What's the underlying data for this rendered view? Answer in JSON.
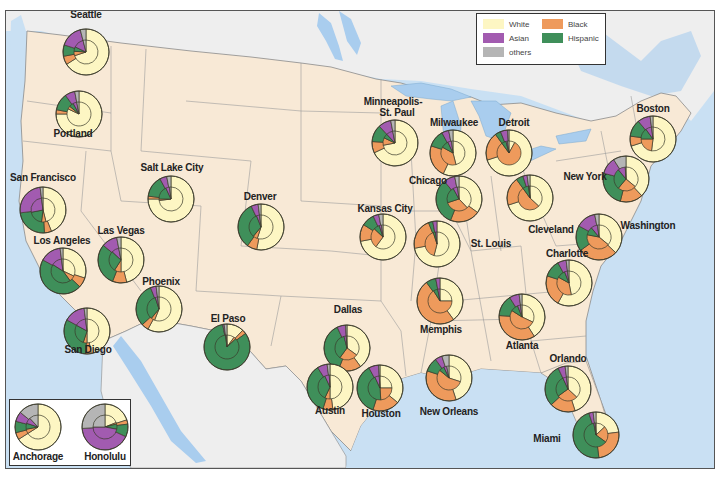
{
  "legend": {
    "items": [
      {
        "key": "white",
        "label": "White",
        "color": "#fdf6c3"
      },
      {
        "key": "black",
        "label": "Black",
        "color": "#ee9a5c"
      },
      {
        "key": "hispanic",
        "label": "Hispanic",
        "color": "#3f8f5a"
      },
      {
        "key": "asian",
        "label": "Asian",
        "color": "#a25bb0"
      },
      {
        "key": "others",
        "label": "others",
        "color": "#b5b5b5"
      }
    ]
  },
  "colors": {
    "water": "#c9e0f3",
    "us_land": "#f8e9d6",
    "foreign_land": "#eeeeee",
    "lake": "#a9cdee",
    "border": "#8a8a8a"
  },
  "chart_data": {
    "type": "pie",
    "categories": [
      "White",
      "Black",
      "Hispanic",
      "Asian",
      "others"
    ],
    "cities": [
      {
        "name": "Seattle",
        "x": 85,
        "y": 51,
        "outer": [
          66,
          6,
          8,
          16,
          4
        ],
        "inner": [
          70,
          6,
          6,
          14,
          4
        ]
      },
      {
        "name": "Portland",
        "x": 78,
        "y": 113,
        "outer": [
          75,
          3,
          12,
          7,
          3
        ],
        "inner": [
          82,
          4,
          6,
          5,
          3
        ]
      },
      {
        "name": "San Francisco",
        "x": 42,
        "y": 209,
        "outer": [
          44,
          5,
          24,
          25,
          2
        ],
        "inner": [
          46,
          6,
          20,
          26,
          2
        ]
      },
      {
        "name": "Los Angeles",
        "x": 62,
        "y": 270,
        "outer": [
          30,
          7,
          46,
          15,
          2
        ],
        "inner": [
          32,
          8,
          44,
          14,
          2
        ]
      },
      {
        "name": "San Diego",
        "x": 86,
        "y": 330,
        "outer": [
          47,
          4,
          32,
          15,
          2
        ],
        "inner": [
          50,
          5,
          28,
          15,
          2
        ]
      },
      {
        "name": "Las Vegas",
        "x": 120,
        "y": 259,
        "outer": [
          46,
          10,
          30,
          11,
          3
        ],
        "inner": [
          50,
          9,
          28,
          10,
          3
        ]
      },
      {
        "name": "Phoenix",
        "x": 158,
        "y": 308,
        "outer": [
          58,
          5,
          31,
          4,
          2
        ],
        "inner": [
          56,
          5,
          34,
          3,
          2
        ]
      },
      {
        "name": "Salt Lake City",
        "x": 170,
        "y": 198,
        "outer": [
          75,
          2,
          15,
          5,
          3
        ],
        "inner": [
          73,
          2,
          18,
          5,
          2
        ]
      },
      {
        "name": "Denver",
        "x": 260,
        "y": 226,
        "outer": [
          53,
          7,
          33,
          5,
          2
        ],
        "inner": [
          55,
          6,
          33,
          4,
          2
        ]
      },
      {
        "name": "El Paso",
        "x": 226,
        "y": 346,
        "outer": [
          12,
          3,
          82,
          1,
          2
        ],
        "inner": [
          10,
          3,
          85,
          1,
          1
        ]
      },
      {
        "name": "Minneapolis-St. Paul",
        "x": 394,
        "y": 142,
        "outer": [
          68,
          8,
          12,
          9,
          3
        ],
        "inner": [
          72,
          10,
          6,
          9,
          3
        ]
      },
      {
        "name": "Milwaukee",
        "x": 452,
        "y": 152,
        "outer": [
          57,
          23,
          12,
          5,
          3
        ],
        "inner": [
          46,
          37,
          10,
          5,
          2
        ]
      },
      {
        "name": "Detroit",
        "x": 508,
        "y": 152,
        "outer": [
          70,
          20,
          4,
          5,
          1
        ],
        "inner": [
          8,
          82,
          6,
          2,
          2
        ]
      },
      {
        "name": "Chicago",
        "x": 458,
        "y": 198,
        "outer": [
          35,
          21,
          33,
          8,
          3
        ],
        "inner": [
          38,
          32,
          22,
          6,
          2
        ]
      },
      {
        "name": "Kansas City",
        "x": 382,
        "y": 236,
        "outer": [
          72,
          12,
          9,
          4,
          3
        ],
        "inner": [
          60,
          27,
          8,
          3,
          2
        ]
      },
      {
        "name": "St. Louis",
        "x": 436,
        "y": 243,
        "outer": [
          72,
          22,
          3,
          3,
          0
        ],
        "inner": [
          54,
          41,
          3,
          2,
          0
        ]
      },
      {
        "name": "Cleveland",
        "x": 529,
        "y": 197,
        "outer": [
          70,
          20,
          5,
          3,
          2
        ],
        "inner": [
          37,
          53,
          8,
          1,
          1
        ]
      },
      {
        "name": "Boston",
        "x": 652,
        "y": 138,
        "outer": [
          70,
          7,
          12,
          9,
          2
        ],
        "inner": [
          52,
          23,
          15,
          8,
          2
        ]
      },
      {
        "name": "New York",
        "x": 625,
        "y": 178,
        "outer": [
          38,
          16,
          25,
          12,
          9
        ],
        "inner": [
          36,
          25,
          28,
          10,
          1
        ]
      },
      {
        "name": "Washington",
        "x": 598,
        "y": 236,
        "outer": [
          37,
          28,
          18,
          14,
          3
        ],
        "inner": [
          36,
          42,
          11,
          9,
          2
        ]
      },
      {
        "name": "Charlotte",
        "x": 568,
        "y": 282,
        "outer": [
          58,
          22,
          12,
          6,
          2
        ],
        "inner": [
          47,
          36,
          11,
          4,
          2
        ]
      },
      {
        "name": "Memphis",
        "x": 439,
        "y": 300,
        "outer": [
          40,
          50,
          7,
          3,
          0
        ],
        "inner": [
          25,
          66,
          6,
          3,
          0
        ]
      },
      {
        "name": "Atlanta",
        "x": 521,
        "y": 316,
        "outer": [
          41,
          35,
          15,
          7,
          2
        ],
        "inner": [
          32,
          52,
          10,
          4,
          2
        ]
      },
      {
        "name": "Dallas",
        "x": 346,
        "y": 347,
        "outer": [
          40,
          16,
          37,
          6,
          1
        ],
        "inner": [
          35,
          25,
          36,
          3,
          1
        ]
      },
      {
        "name": "Austin",
        "x": 329,
        "y": 386,
        "outer": [
          48,
          7,
          36,
          7,
          2
        ],
        "inner": [
          50,
          7,
          36,
          6,
          1
        ]
      },
      {
        "name": "Houston",
        "x": 379,
        "y": 387,
        "outer": [
          36,
          19,
          37,
          7,
          1
        ],
        "inner": [
          25,
          24,
          44,
          6,
          1
        ]
      },
      {
        "name": "New Orleans",
        "x": 448,
        "y": 377,
        "outer": [
          45,
          35,
          10,
          5,
          5
        ],
        "inner": [
          30,
          56,
          7,
          4,
          3
        ]
      },
      {
        "name": "Orlando",
        "x": 567,
        "y": 388,
        "outer": [
          45,
          18,
          30,
          5,
          2
        ],
        "inner": [
          37,
          28,
          28,
          5,
          2
        ]
      },
      {
        "name": "Miami",
        "x": 595,
        "y": 434,
        "outer": [
          23,
          25,
          47,
          3,
          2
        ],
        "inner": [
          13,
          22,
          62,
          2,
          1
        ]
      },
      {
        "name": "Anchorage",
        "x": 37,
        "y": 426,
        "outer": [
          66,
          5,
          8,
          7,
          14
        ],
        "inner": [
          66,
          6,
          8,
          8,
          12
        ]
      },
      {
        "name": "Honolulu",
        "x": 104,
        "y": 426,
        "outer": [
          20,
          3,
          9,
          42,
          26
        ],
        "inner": [
          19,
          2,
          7,
          47,
          25
        ]
      }
    ]
  },
  "labels": [
    {
      "name": "Seattle",
      "x": 85,
      "y": 14
    },
    {
      "name": "Portland",
      "x": 72,
      "y": 133
    },
    {
      "name": "San Francisco",
      "x": 42,
      "y": 177
    },
    {
      "name": "Los Angeles",
      "x": 61,
      "y": 240
    },
    {
      "name": "San Diego",
      "x": 87,
      "y": 349
    },
    {
      "name": "Las Vegas",
      "x": 120,
      "y": 230
    },
    {
      "name": "Phoenix",
      "x": 160,
      "y": 281
    },
    {
      "name": "Salt Lake City",
      "x": 171,
      "y": 167
    },
    {
      "name": "Denver",
      "x": 259,
      "y": 196
    },
    {
      "name": "El Paso",
      "x": 227,
      "y": 318
    },
    {
      "name": "Minneapolis-",
      "x": 392,
      "y": 101
    },
    {
      "name": "St. Paul",
      "x": 396,
      "y": 112
    },
    {
      "name": "Milwaukee",
      "x": 453,
      "y": 122
    },
    {
      "name": "Detroit",
      "x": 513,
      "y": 122
    },
    {
      "name": "Chicago",
      "x": 427,
      "y": 180
    },
    {
      "name": "Kansas City",
      "x": 384,
      "y": 208
    },
    {
      "name": "St. Louis",
      "x": 490,
      "y": 243
    },
    {
      "name": "Cleveland",
      "x": 550,
      "y": 229
    },
    {
      "name": "Boston",
      "x": 652,
      "y": 108
    },
    {
      "name": "New York",
      "x": 584,
      "y": 176
    },
    {
      "name": "Washington",
      "x": 647,
      "y": 225
    },
    {
      "name": "Charlotte",
      "x": 566,
      "y": 253
    },
    {
      "name": "Memphis",
      "x": 440,
      "y": 329
    },
    {
      "name": "Atlanta",
      "x": 521,
      "y": 345
    },
    {
      "name": "Orlando",
      "x": 567,
      "y": 358
    },
    {
      "name": "Dallas",
      "x": 347,
      "y": 309
    },
    {
      "name": "Austin",
      "x": 329,
      "y": 410
    },
    {
      "name": "Houston",
      "x": 380,
      "y": 413
    },
    {
      "name": "New Orleans",
      "x": 448,
      "y": 411
    },
    {
      "name": "Miami",
      "x": 546,
      "y": 438
    },
    {
      "name": "Anchorage",
      "x": 37,
      "y": 456
    },
    {
      "name": "Honolulu",
      "x": 104,
      "y": 456
    }
  ]
}
